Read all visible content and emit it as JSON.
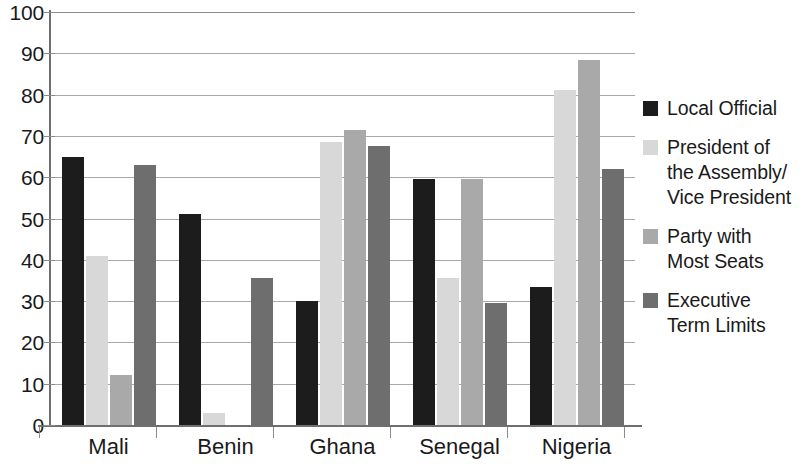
{
  "chart_data": {
    "type": "bar",
    "title": "",
    "subtitle": "",
    "xlabel": "",
    "ylabel": "",
    "ylim": [
      0,
      100
    ],
    "y_ticks": [
      0,
      10,
      20,
      30,
      40,
      50,
      60,
      70,
      80,
      90,
      100
    ],
    "grid": true,
    "legend_position": "right",
    "categories": [
      "Mali",
      "Benin",
      "Ghana",
      "Senegal",
      "Nigeria"
    ],
    "series": [
      {
        "name": "Local Official",
        "color": "#1c1c1c",
        "values": [
          65,
          51,
          30,
          59.5,
          33.5
        ]
      },
      {
        "name": "President of the Assembly/ Vice President",
        "color": "#d8d8d8",
        "values": [
          41,
          3,
          68.5,
          35.5,
          81
        ]
      },
      {
        "name": "Party with Most Seats",
        "color": "#a9a9a9",
        "values": [
          12,
          0,
          71.5,
          59.5,
          88.5
        ]
      },
      {
        "name": "Executive Term Limits",
        "color": "#6e6e6e",
        "values": [
          63,
          35.5,
          67.5,
          29.5,
          62
        ]
      }
    ]
  },
  "legend": {
    "items": [
      {
        "label": "Local Official",
        "color": "#1c1c1c"
      },
      {
        "label": "President of\nthe Assembly/\nVice President",
        "color": "#d8d8d8"
      },
      {
        "label": "Party with\nMost Seats",
        "color": "#a9a9a9"
      },
      {
        "label": "Executive\nTerm Limits",
        "color": "#6e6e6e"
      }
    ]
  },
  "axis": {
    "y_tick_labels": [
      "100",
      "90",
      "80",
      "70",
      "60",
      "50",
      "40",
      "30",
      "20",
      "10",
      "0"
    ],
    "x_tick_labels": [
      "Mali",
      "Benin",
      "Ghana",
      "Senegal",
      "Nigeria"
    ]
  }
}
